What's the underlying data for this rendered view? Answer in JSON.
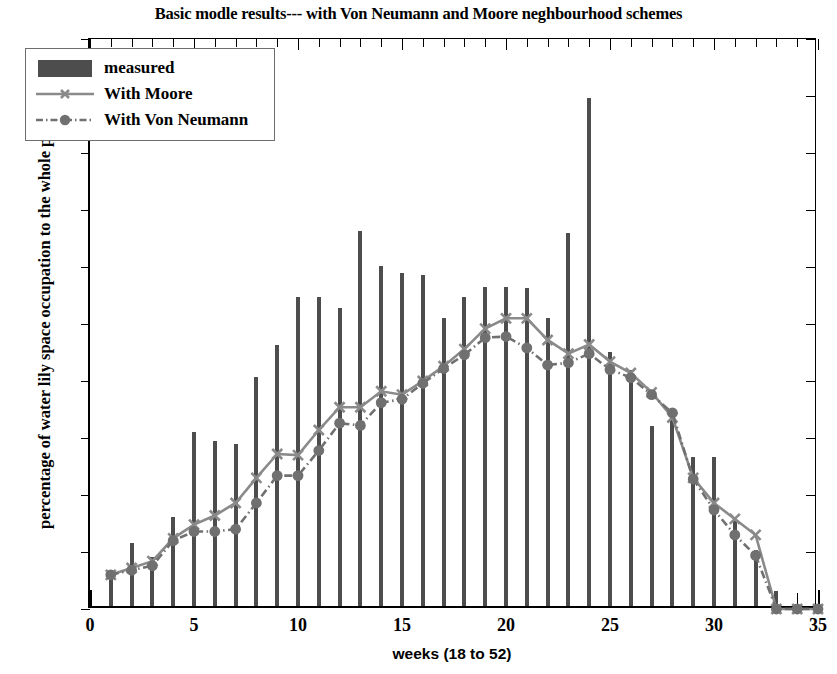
{
  "chart_data": {
    "type": "bar",
    "title": "Basic modle results--- with Von Neumann and Moore neghbourhood schemes",
    "xlabel": "weeks (18 to 52)",
    "ylabel": "percentage of water lily space occupation to the whole pond",
    "xlim": [
      0,
      35
    ],
    "ylim": [
      0,
      0.5
    ],
    "grid": false,
    "legend_position": "upper-left",
    "xticks": [
      0,
      5,
      10,
      15,
      20,
      25,
      30,
      35
    ],
    "xtick_labels": [
      "0",
      "5",
      "10",
      "15",
      "20",
      "25",
      "30",
      "35"
    ],
    "yticks": [
      0,
      0.05,
      0.1,
      0.15,
      0.2,
      0.25,
      0.3,
      0.35,
      0.4,
      0.45,
      0.5
    ],
    "ytick_labels": [
      "0",
      "0.05",
      "0.1",
      "0.15",
      "0.2",
      "0.25",
      "0.3",
      "0.35",
      "0.4",
      "0.45",
      "0.5"
    ],
    "x": [
      1,
      2,
      3,
      4,
      5,
      6,
      7,
      8,
      9,
      10,
      11,
      12,
      13,
      14,
      15,
      16,
      17,
      18,
      19,
      20,
      21,
      22,
      23,
      24,
      25,
      26,
      27,
      28,
      29,
      30,
      31,
      32,
      33,
      34,
      35
    ],
    "series": [
      {
        "name": "measured",
        "type": "bar",
        "color": "#4d4d4d",
        "values": [
          0.03,
          0.055,
          0.043,
          0.078,
          0.153,
          0.145,
          0.142,
          0.201,
          0.229,
          0.271,
          0.271,
          0.261,
          0.329,
          0.298,
          0.292,
          0.29,
          0.253,
          0.271,
          0.28,
          0.28,
          0.279,
          0.253,
          0.327,
          0.446,
          0.223,
          0.207,
          0.158,
          0.168,
          0.131,
          0.131,
          0.075,
          0.049,
          0.013,
          0.0,
          0.0
        ]
      },
      {
        "name": "With Moore",
        "type": "line",
        "color": "#8a8a8a",
        "marker": "x",
        "linestyle": "solid",
        "values": [
          0.03,
          0.036,
          0.042,
          0.062,
          0.074,
          0.082,
          0.093,
          0.115,
          0.136,
          0.135,
          0.157,
          0.177,
          0.177,
          0.191,
          0.188,
          0.2,
          0.213,
          0.228,
          0.246,
          0.255,
          0.255,
          0.236,
          0.224,
          0.232,
          0.217,
          0.207,
          0.19,
          0.168,
          0.115,
          0.093,
          0.079,
          0.065,
          0.0,
          0.0,
          0.0
        ]
      },
      {
        "name": "With Von Neumann",
        "type": "line",
        "color": "#707070",
        "marker": "o",
        "linestyle": "dashdot",
        "values": [
          0.03,
          0.034,
          0.038,
          0.06,
          0.068,
          0.068,
          0.07,
          0.093,
          0.117,
          0.117,
          0.139,
          0.163,
          0.161,
          0.181,
          0.184,
          0.198,
          0.211,
          0.223,
          0.238,
          0.239,
          0.229,
          0.214,
          0.216,
          0.224,
          0.21,
          0.203,
          0.188,
          0.172,
          0.114,
          0.087,
          0.065,
          0.047,
          0.0,
          0.0,
          0.0
        ]
      }
    ]
  },
  "legend": {
    "items": [
      {
        "label": "measured"
      },
      {
        "label": "With Moore"
      },
      {
        "label": "With Von Neumann"
      }
    ]
  }
}
